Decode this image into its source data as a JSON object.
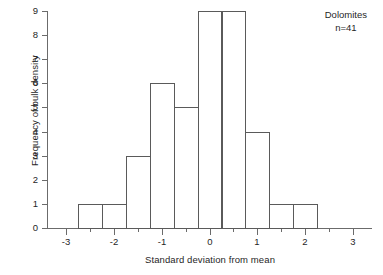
{
  "chart_data": {
    "type": "bar",
    "title": "",
    "subtitle": "",
    "xlabel": "Standard deviation from mean",
    "ylabel": "Frequency of bulk density",
    "xlim": [
      -3.4,
      3.4
    ],
    "ylim": [
      0,
      9
    ],
    "grid": false,
    "legend_position": "none",
    "bin_width": 0.5,
    "bin_edges": [
      -2.75,
      -2.25,
      -1.75,
      -1.25,
      -0.75,
      -0.25,
      0.25,
      0.75,
      1.25,
      1.75,
      2.25
    ],
    "bin_centers": [
      -2.5,
      -2.0,
      -1.5,
      -1.0,
      -0.5,
      0.0,
      0.5,
      1.0,
      1.5,
      2.0
    ],
    "values": [
      1,
      1,
      3,
      6,
      5,
      9,
      9,
      4,
      1,
      1
    ],
    "categories": [
      "-2.5",
      "-2.0",
      "-1.5",
      "-1.0",
      "-0.5",
      "0.0",
      "0.5",
      "1.0",
      "1.5",
      "2.0"
    ],
    "x_ticks_major": [
      -3,
      -2,
      -1,
      0,
      1,
      2,
      3
    ],
    "x_tick_labels": [
      "-3",
      "-2",
      "-1",
      "0",
      "1",
      "2",
      "3"
    ],
    "x_ticks_minor": [
      -2.5,
      -1.5,
      -0.5,
      0.5,
      1.5,
      2.5
    ],
    "y_ticks": [
      0,
      1,
      2,
      3,
      4,
      5,
      6,
      7,
      8,
      9
    ],
    "y_tick_labels": [
      "0",
      "1",
      "2",
      "3",
      "4",
      "5",
      "6",
      "7",
      "8",
      "9"
    ],
    "annotations": [
      {
        "text": "Dolomites"
      },
      {
        "text": "n=41"
      }
    ],
    "colors": {
      "bar_stroke": "#5a5a5a",
      "bar_fill": "transparent",
      "axis": "#6b6b6b",
      "text": "#1f1f1f",
      "background": "#ffffff"
    }
  }
}
